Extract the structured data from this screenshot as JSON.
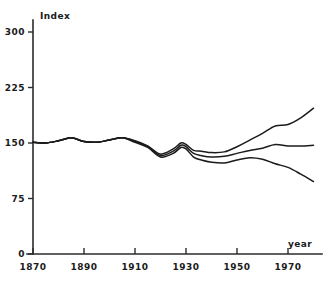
{
  "chart_data": {
    "type": "line",
    "title": "",
    "subtitle": "",
    "xlabel": "year",
    "ylabel": "Index",
    "xlim": [
      1870,
      1980
    ],
    "ylim": [
      0,
      300
    ],
    "grid": false,
    "legend_position": "none",
    "x_ticks": [
      1870,
      1890,
      1910,
      1930,
      1950,
      1970
    ],
    "x_tick_labels": [
      "1870",
      "1890",
      "1910",
      "1930",
      "1950",
      "1970"
    ],
    "y_ticks": [
      0,
      75,
      150,
      225,
      300
    ],
    "y_tick_labels": [
      "0",
      "75",
      "150",
      "225",
      "300"
    ],
    "x": [
      1870,
      1875,
      1880,
      1885,
      1890,
      1895,
      1900,
      1905,
      1910,
      1915,
      1920,
      1925,
      1928,
      1930,
      1933,
      1936,
      1940,
      1945,
      1950,
      1955,
      1960,
      1965,
      1970,
      1975,
      1980
    ],
    "series": [
      {
        "name": "upper",
        "values": [
          151,
          150,
          153,
          157,
          152,
          151,
          154,
          157,
          153,
          146,
          135,
          142,
          150,
          148,
          140,
          139,
          137,
          138,
          145,
          154,
          163,
          173,
          175,
          184,
          197
        ]
      },
      {
        "name": "middle",
        "values": [
          151,
          150,
          153,
          157,
          152,
          151,
          154,
          157,
          152,
          145,
          133,
          139,
          147,
          145,
          136,
          133,
          131,
          132,
          136,
          140,
          143,
          148,
          146,
          146,
          147
        ]
      },
      {
        "name": "lower",
        "values": [
          151,
          150,
          153,
          157,
          152,
          151,
          154,
          157,
          151,
          144,
          131,
          136,
          144,
          142,
          131,
          127,
          124,
          123,
          127,
          130,
          128,
          122,
          117,
          108,
          98
        ]
      }
    ]
  }
}
